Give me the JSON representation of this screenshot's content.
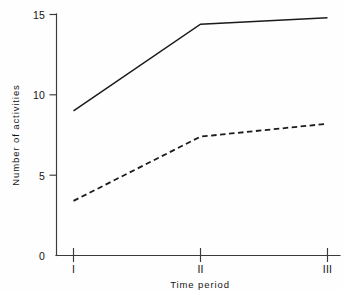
{
  "chart_data": {
    "type": "line",
    "title": "",
    "xlabel": "Time period",
    "ylabel": "Number of activities",
    "categories": [
      "I",
      "II",
      "III"
    ],
    "x": [
      1,
      2,
      3
    ],
    "xlim": [
      0.72,
      3.12
    ],
    "ylim": [
      0,
      15
    ],
    "yticks": [
      0,
      5,
      10,
      15
    ],
    "ytick_labels": [
      "0",
      "5",
      "10",
      "15"
    ],
    "xtick_labels": [
      "I",
      "II",
      "III"
    ],
    "grid": false,
    "legend": null,
    "series": [
      {
        "name": "solid-series",
        "style": "solid",
        "color": "#1b1b1b",
        "values": [
          9.0,
          14.4,
          14.8
        ]
      },
      {
        "name": "dashed-series",
        "style": "dashed",
        "color": "#1b1b1b",
        "values": [
          3.4,
          7.4,
          8.2
        ]
      }
    ]
  },
  "axes": {
    "y_title": "Number of activities",
    "x_title": "Time period",
    "y_tick_0": "0",
    "y_tick_1": "5",
    "y_tick_2": "10",
    "y_tick_3": "15",
    "x_tick_0": "I",
    "x_tick_1": "II",
    "x_tick_2": "III"
  }
}
